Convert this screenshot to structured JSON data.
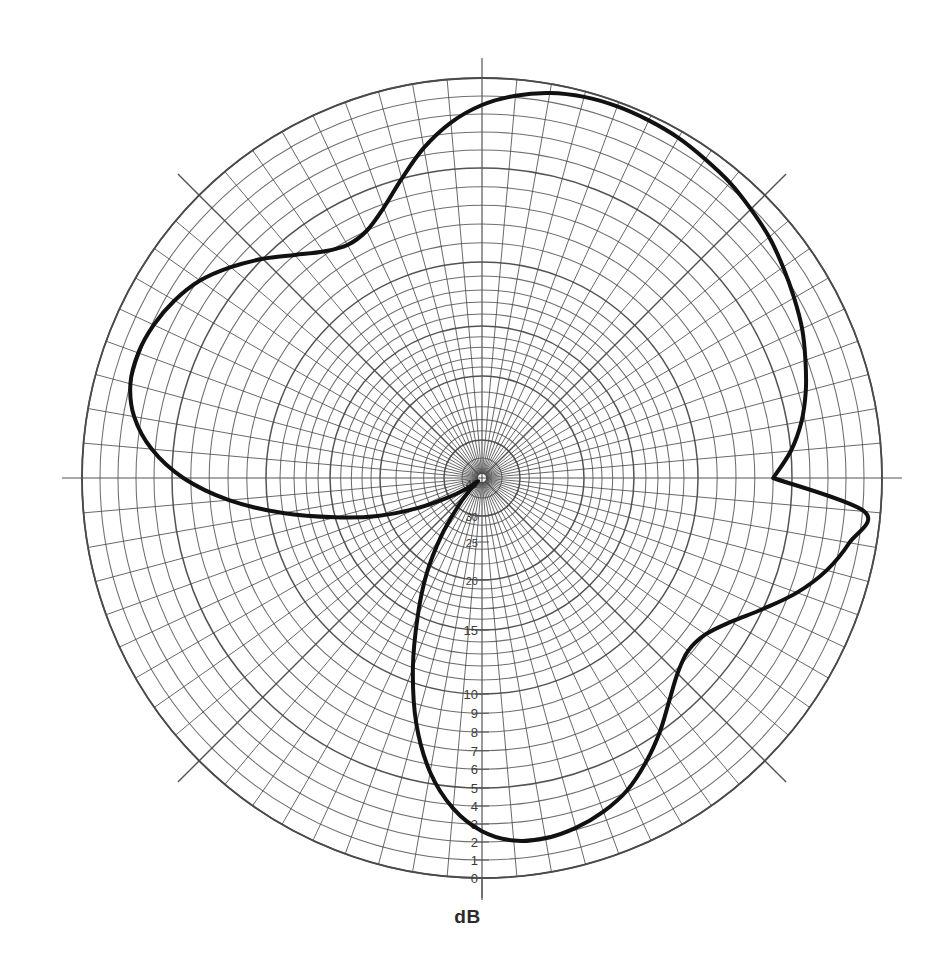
{
  "figure": {
    "unit_label": "dB",
    "background": "#ffffff",
    "grid_color": "#4a4a4a",
    "trace_color": "#111111",
    "axis_color": "#555555"
  },
  "chart_data": {
    "type": "line",
    "projection": "polar",
    "title": "",
    "subtitle": "",
    "xlabel": "",
    "ylabel": "dB",
    "annotations": [],
    "legend": {
      "entries": [],
      "position": "none"
    },
    "grid": true,
    "angular_axis": {
      "unit": "degrees",
      "direction": "counterclockwise",
      "zero_at": "east",
      "minor_spoke_step_deg": 5,
      "major_spoke_step_deg": 45,
      "major_spokes_deg": [
        0,
        45,
        90,
        135,
        180,
        225,
        270,
        315
      ],
      "tick_labels": []
    },
    "radial_axis": {
      "label": "dB",
      "outer_value": 0,
      "center_value": 40,
      "direction": "value increases inward",
      "tick_values": [
        0,
        1,
        2,
        3,
        4,
        5,
        6,
        7,
        8,
        9,
        10,
        15,
        20,
        25,
        30,
        40
      ],
      "tick_labels": [
        "0",
        "1",
        "2",
        "3",
        "4",
        "5",
        "6",
        "7",
        "8",
        "9",
        "10",
        "15",
        "20",
        "25",
        "30",
        "40"
      ],
      "labelled_axis_deg": 270,
      "ring_values": [
        0,
        1,
        2,
        3,
        4,
        5,
        6,
        7,
        8,
        9,
        10,
        11,
        12,
        13,
        14,
        15,
        16,
        17,
        18,
        19,
        20,
        22,
        24,
        26,
        28,
        30,
        35,
        40
      ],
      "rlim": [
        0,
        40
      ]
    },
    "series": [
      {
        "name": "radiation pattern",
        "line_width_px": 4,
        "closed": true,
        "theta_deg": [
          0,
          5,
          10,
          15,
          20,
          25,
          30,
          35,
          40,
          45,
          50,
          55,
          60,
          65,
          70,
          75,
          80,
          85,
          90,
          95,
          100,
          105,
          110,
          115,
          120,
          125,
          130,
          135,
          140,
          145,
          150,
          155,
          160,
          165,
          170,
          175,
          180,
          185,
          190,
          195,
          200,
          205,
          210,
          215,
          220,
          225,
          230,
          235,
          240,
          245,
          250,
          255,
          260,
          265,
          270,
          275,
          280,
          285,
          290,
          295,
          300,
          305,
          310,
          315,
          320,
          325,
          330,
          335,
          340,
          345,
          350,
          355
        ],
        "values_db": [
          6.0,
          5.0,
          4.2,
          3.6,
          3.1,
          2.6,
          2.2,
          1.8,
          1.4,
          1.1,
          0.8,
          0.6,
          0.4,
          0.3,
          0.25,
          0.3,
          0.5,
          0.9,
          1.5,
          2.4,
          3.6,
          5.0,
          6.2,
          7.0,
          7.2,
          6.8,
          6.0,
          5.0,
          4.0,
          3.1,
          2.5,
          2.1,
          1.9,
          2.0,
          2.6,
          3.8,
          5.6,
          8.0,
          11.0,
          15.0,
          19.0,
          24.0,
          30.0,
          36.0,
          40.0,
          36.0,
          30.0,
          24.0,
          19.0,
          15.0,
          11.0,
          8.0,
          5.6,
          3.8,
          2.6,
          2.0,
          1.9,
          2.1,
          2.5,
          3.1,
          4.0,
          5.0,
          6.0,
          6.8,
          7.2,
          7.0,
          6.2,
          5.0,
          3.6,
          2.4,
          1.5,
          0.9
        ]
      }
    ]
  }
}
